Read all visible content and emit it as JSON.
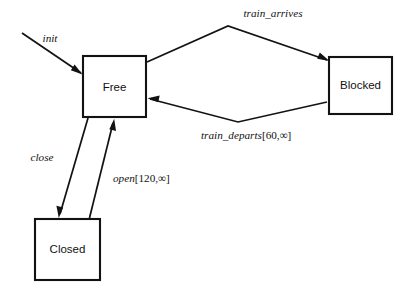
{
  "diagram": {
    "type": "state-machine",
    "title": "",
    "background_color": "#ffffff",
    "line_color": "#121212",
    "states": [
      {
        "id": "free",
        "label": "Free",
        "x": 83,
        "y": 56,
        "width": 63,
        "height": 61
      },
      {
        "id": "blocked",
        "label": "Blocked",
        "x": 329,
        "y": 57,
        "width": 63,
        "height": 57
      },
      {
        "id": "closed",
        "label": "Closed",
        "x": 35,
        "y": 219,
        "width": 65,
        "height": 61
      }
    ],
    "transitions": [
      {
        "id": "init",
        "label": "init",
        "from": "",
        "to": "free",
        "label_x": 50,
        "label_y": 42
      },
      {
        "id": "train-arrives",
        "label": "train_arrives",
        "from": "free",
        "to": "blocked",
        "label_x": 273,
        "label_y": 17
      },
      {
        "id": "train-departs",
        "label_name": "train_departs",
        "label_guard": "[60,∞]",
        "label": "train_departs[60,∞]",
        "from": "blocked",
        "to": "free",
        "label_x": 201,
        "label_y": 139
      },
      {
        "id": "close",
        "label": "close",
        "from": "free",
        "to": "closed",
        "label_x": 42,
        "label_y": 161
      },
      {
        "id": "open",
        "label_name": "open",
        "label_guard": "[120,∞]",
        "label": "open[120,∞]",
        "from": "closed",
        "to": "free",
        "label_x": 113,
        "label_y": 182
      }
    ]
  }
}
